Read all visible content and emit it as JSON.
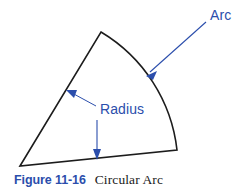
{
  "figure": {
    "caption": {
      "number_label": "Figure 11-16",
      "title": "Circular Arc",
      "number_color": "#2b4eac",
      "title_color": "#1a1a1a"
    },
    "annotations": [
      {
        "id": "arc",
        "label": "Arc",
        "color": "#2b4eac",
        "text_x": 212,
        "text_y": 16,
        "leader_from_x": 206,
        "leader_from_y": 22,
        "leader_to_x": 148,
        "leader_to_y": 74,
        "arrow_angle_deg": 138
      },
      {
        "id": "radius-side",
        "label": "Radius",
        "color": "#2b4eac",
        "text_x": 100,
        "text_y": 114,
        "leader_from_x": 96,
        "leader_from_y": 106,
        "leader_to_x": 68,
        "leader_to_y": 91,
        "arrow_angle_deg": 208
      },
      {
        "id": "radius-bottom",
        "label": "",
        "color": "#2b4eac",
        "leader_from_x": 97,
        "leader_from_y": 120,
        "leader_to_x": 97,
        "leader_to_y": 159,
        "arrow_angle_deg": 90
      }
    ],
    "shape": {
      "name": "circular-sector",
      "stroke_color": "#1c1c1c",
      "stroke_width": 1.6,
      "fill": "none",
      "apex_x": 20,
      "apex_y": 166,
      "radius_end_top_x": 101,
      "radius_end_top_y": 32,
      "radius_end_right_x": 177,
      "radius_end_right_y": 150,
      "arc_radius": 158,
      "arc_path": "M 20 166 L 101 32 A 158 158 0 0 1 177 150 Z"
    }
  }
}
